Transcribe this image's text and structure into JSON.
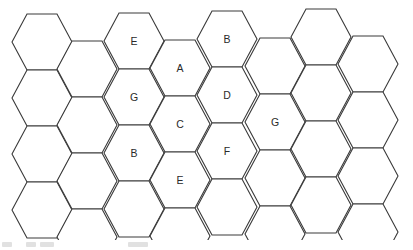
{
  "diagram": {
    "type": "hexagonal-grid",
    "columns": 8,
    "rows_per_column": 4,
    "hex_side_px": 30,
    "hex_height_px": 56,
    "stroke_color": "#3a3a3a",
    "fill_color": "#ffffff",
    "column_left_x": [
      12,
      57,
      104,
      150,
      197,
      245,
      291,
      338
    ],
    "column_top_y": [
      14,
      41,
      13,
      40,
      11,
      38,
      9,
      36
    ],
    "labels": [
      {
        "col": 2,
        "row": 0,
        "text": "E"
      },
      {
        "col": 2,
        "row": 1,
        "text": "G"
      },
      {
        "col": 2,
        "row": 2,
        "text": "B"
      },
      {
        "col": 3,
        "row": 0,
        "text": "A"
      },
      {
        "col": 3,
        "row": 1,
        "text": "C"
      },
      {
        "col": 3,
        "row": 2,
        "text": "E"
      },
      {
        "col": 4,
        "row": 0,
        "text": "B"
      },
      {
        "col": 4,
        "row": 1,
        "text": "D"
      },
      {
        "col": 4,
        "row": 2,
        "text": "F"
      },
      {
        "col": 5,
        "row": 1,
        "text": "G"
      }
    ]
  },
  "footer": {
    "illegible_scan_marks": [
      {
        "x": 2,
        "w": 10
      },
      {
        "x": 26,
        "w": 10
      },
      {
        "x": 40,
        "w": 14
      },
      {
        "x": 128,
        "w": 20
      }
    ]
  }
}
